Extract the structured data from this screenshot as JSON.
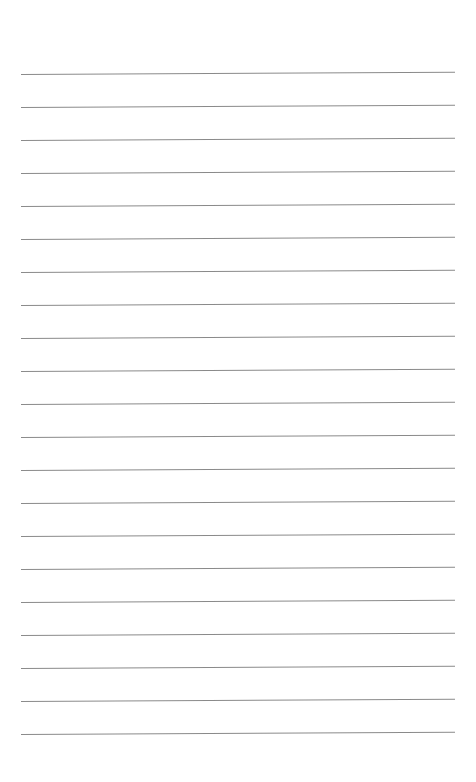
{
  "page": {
    "type": "ruled-sheet",
    "background": "#ffffff",
    "rule_color": "#8a8a8a",
    "rule_left": 21,
    "rule_right": 455,
    "rule_thickness": 1,
    "rule_tilt_deg": -0.3,
    "rules_y": [
      74,
      107,
      140,
      173,
      206,
      239,
      272,
      305,
      338,
      371,
      404,
      437,
      470,
      503,
      536,
      569,
      602,
      635,
      668,
      701,
      734
    ],
    "text": []
  }
}
